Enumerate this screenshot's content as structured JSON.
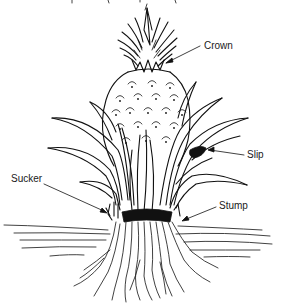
{
  "figure": {
    "title_partial": "",
    "labels": {
      "crown": "Crown",
      "slip": "Slip",
      "sucker": "Sucker",
      "stump": "Stump"
    },
    "colors": {
      "ink": "#111111",
      "background": "#ffffff"
    }
  }
}
